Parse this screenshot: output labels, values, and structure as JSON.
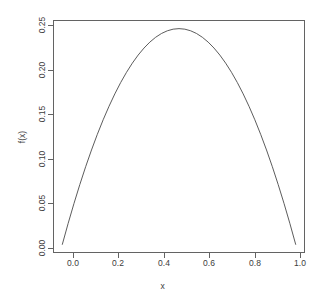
{
  "chart_data": {
    "type": "line",
    "title": "",
    "xlabel": "x",
    "ylabel": "f(x)",
    "xlim": [
      0.0,
      1.0
    ],
    "ylim": [
      0.0,
      0.25
    ],
    "grid": false,
    "legend": null,
    "line_color": "#4a4a4a",
    "box_color": "#636363",
    "background": "#ffffff",
    "xticks": [
      "0.0",
      "0.2",
      "0.4",
      "0.6",
      "0.8",
      "1.0"
    ],
    "xtick_values": [
      0.0,
      0.2,
      0.4,
      0.6,
      0.8,
      1.0
    ],
    "yticks": [
      "0.00",
      "0.05",
      "0.10",
      "0.15",
      "0.20",
      "0.25"
    ],
    "ytick_values": [
      0.0,
      0.05,
      0.1,
      0.15,
      0.2,
      0.25
    ],
    "series": [
      {
        "name": "f(x) = x(1 - x)",
        "x": [
          0.0,
          0.025,
          0.05,
          0.075,
          0.1,
          0.125,
          0.15,
          0.175,
          0.2,
          0.225,
          0.25,
          0.275,
          0.3,
          0.325,
          0.35,
          0.375,
          0.4,
          0.425,
          0.45,
          0.475,
          0.5,
          0.525,
          0.55,
          0.575,
          0.6,
          0.625,
          0.65,
          0.675,
          0.7,
          0.725,
          0.75,
          0.775,
          0.8,
          0.825,
          0.85,
          0.875,
          0.9,
          0.925,
          0.95,
          0.975,
          1.0
        ],
        "values": [
          0.0,
          0.024375,
          0.0475,
          0.069375,
          0.09,
          0.109375,
          0.1275,
          0.144375,
          0.16,
          0.174375,
          0.1875,
          0.199375,
          0.21,
          0.219375,
          0.2275,
          0.234375,
          0.24,
          0.244375,
          0.2475,
          0.249375,
          0.25,
          0.249375,
          0.2475,
          0.244375,
          0.24,
          0.234375,
          0.2275,
          0.219375,
          0.21,
          0.199375,
          0.1875,
          0.174375,
          0.16,
          0.144375,
          0.1275,
          0.109375,
          0.09,
          0.069375,
          0.0475,
          0.024375,
          0.0
        ]
      }
    ],
    "peak": {
      "x": 0.5,
      "y": 0.25
    }
  },
  "axes": {
    "x_label": "x",
    "y_label": "f(x)"
  }
}
